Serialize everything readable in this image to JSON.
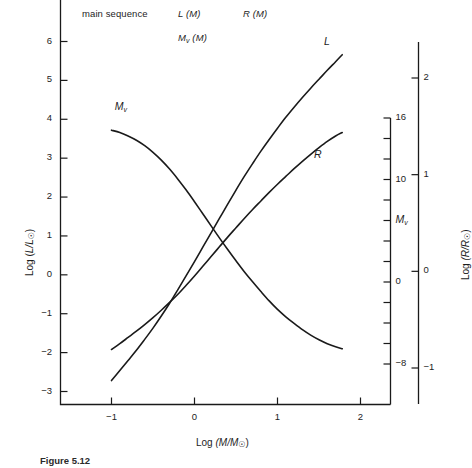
{
  "figure": {
    "header_items": [
      {
        "text": "main sequence",
        "italic": false,
        "x": 82,
        "y": 8
      },
      {
        "text": "L (M)",
        "italic": true,
        "x": 178,
        "y": 8
      },
      {
        "text": "R (M)",
        "italic": true,
        "x": 243,
        "y": 8
      },
      {
        "text": "Mv (M)",
        "italic": true,
        "x": 178,
        "y": 32
      }
    ],
    "caption": "Figure 5.12   Observational data",
    "caption_label": "Figure 5.12"
  },
  "chart_data": {
    "type": "line",
    "title": "main sequence",
    "xlabel": "Log (M/M☉)",
    "ylabel": "Log (L/L☉)",
    "y2label": "Log (R/R☉)",
    "y3label": "Mv",
    "xlim": [
      -1.3,
      2.25
    ],
    "ylim": [
      -3.35,
      6.45
    ],
    "y2lim": [
      -1.35,
      2.45
    ],
    "y3lim": [
      -9.6,
      18.0
    ],
    "grid": false,
    "legend": "inline-curve-labels",
    "xticks": [
      -1,
      0,
      1,
      2
    ],
    "xticklabels": [
      "−1",
      "0",
      "1",
      "2"
    ],
    "yticks": [
      -3,
      -2,
      -1,
      0,
      1,
      2,
      3,
      4,
      5,
      6
    ],
    "yticklabels": [
      "−3",
      "−2",
      "−1",
      "0",
      "1",
      "2",
      "3",
      "4",
      "5",
      "6"
    ],
    "y2ticks": [
      -1,
      0,
      1,
      2
    ],
    "y2ticklabels": [
      "−1",
      "0",
      "1",
      "2"
    ],
    "y3ticks": [
      -8,
      -6,
      -4,
      -2,
      0,
      2,
      4,
      6,
      8,
      10,
      12,
      14,
      16
    ],
    "y3ticklabels": [
      "−8",
      "",
      "",
      "",
      "0",
      "",
      "",
      "",
      "",
      "10",
      "",
      "",
      "16"
    ],
    "series": [
      {
        "name": "L",
        "label": "L",
        "axis": "left",
        "label_position": {
          "x": 1.62,
          "y": 5.95
        },
        "points": [
          [
            -1.0,
            -2.72
          ],
          [
            -0.9,
            -2.46
          ],
          [
            -0.8,
            -2.2
          ],
          [
            -0.7,
            -1.94
          ],
          [
            -0.6,
            -1.66
          ],
          [
            -0.5,
            -1.37
          ],
          [
            -0.4,
            -1.06
          ],
          [
            -0.3,
            -0.73
          ],
          [
            -0.2,
            -0.38
          ],
          [
            -0.1,
            -0.02
          ],
          [
            0.0,
            0.34
          ],
          [
            0.1,
            0.71
          ],
          [
            0.2,
            1.08
          ],
          [
            0.3,
            1.45
          ],
          [
            0.4,
            1.82
          ],
          [
            0.5,
            2.18
          ],
          [
            0.6,
            2.53
          ],
          [
            0.7,
            2.86
          ],
          [
            0.8,
            3.18
          ],
          [
            0.9,
            3.48
          ],
          [
            1.0,
            3.77
          ],
          [
            1.1,
            4.05
          ],
          [
            1.2,
            4.31
          ],
          [
            1.3,
            4.56
          ],
          [
            1.4,
            4.8
          ],
          [
            1.5,
            5.03
          ],
          [
            1.6,
            5.26
          ],
          [
            1.7,
            5.48
          ],
          [
            1.78,
            5.66
          ]
        ]
      },
      {
        "name": "R",
        "label": "R",
        "axis": "left_mapped_radius",
        "label_position": {
          "x": 1.5,
          "y": 3.05
        },
        "points": [
          [
            -1.0,
            -1.92
          ],
          [
            -0.9,
            -1.77
          ],
          [
            -0.8,
            -1.61
          ],
          [
            -0.7,
            -1.45
          ],
          [
            -0.6,
            -1.28
          ],
          [
            -0.5,
            -1.1
          ],
          [
            -0.4,
            -0.91
          ],
          [
            -0.3,
            -0.71
          ],
          [
            -0.2,
            -0.5
          ],
          [
            -0.1,
            -0.27
          ],
          [
            0.0,
            -0.03
          ],
          [
            0.1,
            0.22
          ],
          [
            0.2,
            0.47
          ],
          [
            0.3,
            0.72
          ],
          [
            0.4,
            0.97
          ],
          [
            0.5,
            1.21
          ],
          [
            0.6,
            1.45
          ],
          [
            0.7,
            1.68
          ],
          [
            0.8,
            1.9
          ],
          [
            0.9,
            2.12
          ],
          [
            1.0,
            2.33
          ],
          [
            1.1,
            2.53
          ],
          [
            1.2,
            2.73
          ],
          [
            1.3,
            2.92
          ],
          [
            1.4,
            3.1
          ],
          [
            1.5,
            3.27
          ],
          [
            1.6,
            3.43
          ],
          [
            1.7,
            3.57
          ],
          [
            1.78,
            3.66
          ]
        ]
      },
      {
        "name": "Mv",
        "label": "Mv",
        "axis": "right_absolute_magnitude",
        "label_position": {
          "x": -0.9,
          "y": 4.28
        },
        "points": [
          [
            -1.0,
            3.72
          ],
          [
            -0.9,
            3.66
          ],
          [
            -0.8,
            3.57
          ],
          [
            -0.7,
            3.46
          ],
          [
            -0.6,
            3.32
          ],
          [
            -0.5,
            3.15
          ],
          [
            -0.4,
            2.95
          ],
          [
            -0.3,
            2.72
          ],
          [
            -0.2,
            2.46
          ],
          [
            -0.1,
            2.18
          ],
          [
            0.0,
            1.88
          ],
          [
            0.1,
            1.57
          ],
          [
            0.2,
            1.26
          ],
          [
            0.3,
            0.95
          ],
          [
            0.4,
            0.65
          ],
          [
            0.5,
            0.36
          ],
          [
            0.6,
            0.08
          ],
          [
            0.7,
            -0.18
          ],
          [
            0.8,
            -0.43
          ],
          [
            0.9,
            -0.67
          ],
          [
            1.0,
            -0.89
          ],
          [
            1.1,
            -1.08
          ],
          [
            1.2,
            -1.25
          ],
          [
            1.3,
            -1.41
          ],
          [
            1.4,
            -1.55
          ],
          [
            1.5,
            -1.67
          ],
          [
            1.6,
            -1.77
          ],
          [
            1.7,
            -1.85
          ],
          [
            1.78,
            -1.9
          ]
        ]
      }
    ]
  },
  "axes": {
    "left": {
      "name": "Log (L/Lsun)",
      "prefix": "Log (",
      "italic": "L/L",
      "sun": "☉",
      "suffix": ")"
    },
    "bottom": {
      "name": "Log (M/Msun)",
      "prefix": "Log ",
      "italic": "(M/M",
      "sun": "☉",
      "suffix": ")"
    },
    "right_outer": {
      "name": "Log (R/Rsun)",
      "prefix": "Log ",
      "italic": "(R/R",
      "sun": "☉",
      "suffix": ")"
    },
    "right_inner": {
      "name": "Mv"
    }
  }
}
